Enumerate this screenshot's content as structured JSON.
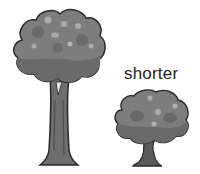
{
  "illustration": {
    "caption": "shorter",
    "trees": [
      {
        "id": "tall-tree",
        "size": "tall"
      },
      {
        "id": "short-tree",
        "size": "short"
      }
    ],
    "colors": {
      "crown": "#7d7d7d",
      "crown_dark": "#6a6a6a",
      "crown_light": "#a9a9a9",
      "trunk": "#6e6e6e",
      "outline": "#2a2a2a"
    }
  }
}
